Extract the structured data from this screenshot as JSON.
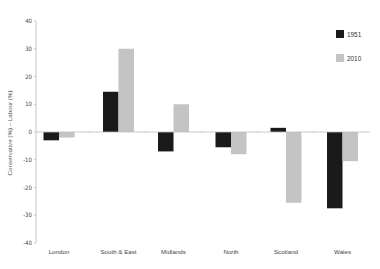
{
  "chart_data": {
    "type": "bar",
    "title": "",
    "xlabel": "",
    "ylabel": "Conservative (%) – Labour (%)",
    "ylim": [
      -40,
      40
    ],
    "yticks": [
      40,
      30,
      20,
      10,
      0,
      -10,
      -20,
      -30,
      -40
    ],
    "grid": false,
    "legend_position": "top-right",
    "categories": [
      "London",
      "South & East",
      "Midlands",
      "North",
      "Scotland",
      "Wales"
    ],
    "series": [
      {
        "name": "1951",
        "color": "#1a1a1a",
        "values": [
          -3,
          14.5,
          -7,
          -5.5,
          1.5,
          -27.5
        ]
      },
      {
        "name": "2010",
        "color": "#c4c4c4",
        "values": [
          -2,
          30,
          10,
          -8,
          -25.5,
          -10.5
        ]
      }
    ]
  },
  "legend": {
    "items": [
      {
        "label": "1951",
        "color": "#1a1a1a"
      },
      {
        "label": "2010",
        "color": "#c4c4c4"
      }
    ]
  }
}
